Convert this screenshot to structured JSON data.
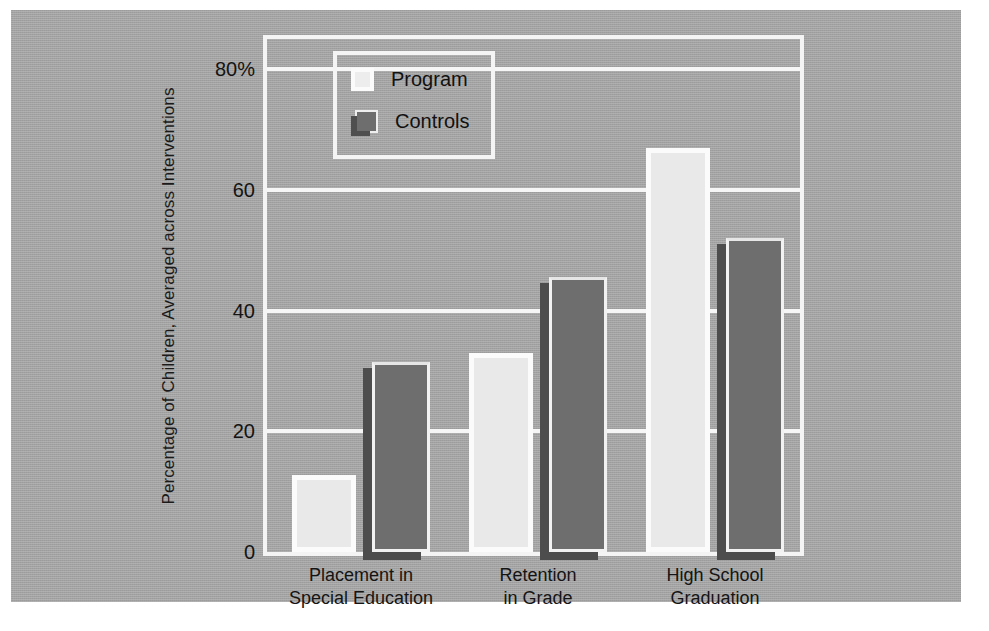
{
  "chart_data": {
    "type": "bar",
    "title": "",
    "xlabel": "",
    "ylabel": "Percentage of Children, Averaged across Interventions",
    "categories": [
      "Placement in\nSpecial Education",
      "Retention\nin Grade",
      "High School\nGraduation"
    ],
    "category_lines": [
      [
        "Placement in",
        "Special Education"
      ],
      [
        "Retention",
        "in Grade"
      ],
      [
        "High School",
        "Graduation"
      ]
    ],
    "series": [
      {
        "name": "Program",
        "values": [
          12.8,
          33.0,
          67.0
        ]
      },
      {
        "name": "Controls",
        "values": [
          31.5,
          45.5,
          52.0
        ]
      }
    ],
    "ylim": [
      0,
      85
    ],
    "yticks": [
      0,
      20,
      40,
      60,
      80
    ],
    "ytick_labels": [
      "0",
      "20",
      "40",
      "60",
      "80%"
    ],
    "grid": true,
    "legend_position": "upper-left-inside",
    "colors": {
      "background": "#a9a9a9",
      "program_fill": "#e9e9e9",
      "program_edge": "#fbfbfb",
      "controls_fill": "#6e6e6e",
      "controls_edge": "#f2f2f2",
      "controls_shadow": "#4d4d4d",
      "gridline": "#f6f6f6",
      "text": "#141414"
    }
  },
  "figure": {
    "axis_title_y": "Percentage of Children, Averaged across Interventions",
    "legend_items": [
      "Program",
      "Controls"
    ]
  }
}
